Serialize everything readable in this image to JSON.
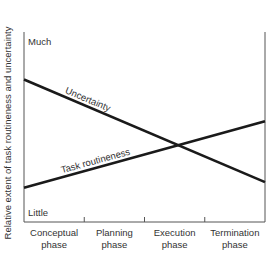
{
  "chart_data": {
    "type": "line",
    "title": "",
    "xlabel": "",
    "ylabel": "Relative extent of task routineness and uncertainty",
    "categories": [
      "Conceptual phase",
      "Planning phase",
      "Execution phase",
      "Termination phase"
    ],
    "category_labels": [
      [
        "Conceptual",
        "phase"
      ],
      [
        "Planning",
        "phase"
      ],
      [
        "Execution",
        "phase"
      ],
      [
        "Termination",
        "phase"
      ]
    ],
    "x_range": [
      0,
      4
    ],
    "ylim": [
      0,
      1
    ],
    "y_tick_labels": {
      "top": "Much",
      "bottom": "Little"
    },
    "grid": false,
    "legend": "none (series labeled inline along lines)",
    "series": [
      {
        "name": "Uncertainty",
        "x": [
          0,
          4
        ],
        "values": [
          0.75,
          0.21
        ]
      },
      {
        "name": "Task routineness",
        "x": [
          0,
          4
        ],
        "values": [
          0.18,
          0.53
        ]
      }
    ],
    "annotations": [
      "Uncertainty",
      "Task routineness"
    ]
  }
}
